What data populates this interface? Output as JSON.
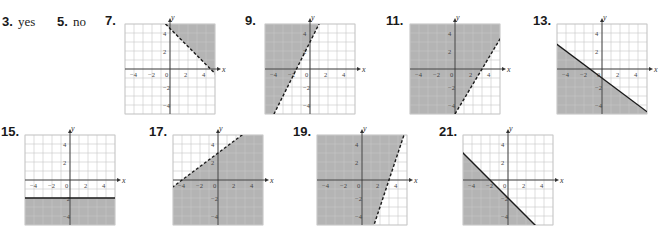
{
  "answers": [
    {
      "number": "3.",
      "text": "yes"
    },
    {
      "number": "5.",
      "text": "no"
    }
  ],
  "graphs": [
    {
      "number": "7.",
      "x": 125,
      "y": 24,
      "slope": -1,
      "intercept": 4.5,
      "vertical": null,
      "dashed": true,
      "shade": "above"
    },
    {
      "number": "9.",
      "x": 265,
      "y": 24,
      "slope": 2,
      "intercept": 3,
      "vertical": null,
      "dashed": true,
      "shade": "above"
    },
    {
      "number": "11.",
      "x": 410,
      "y": 24,
      "slope": 1.667,
      "intercept": -5,
      "vertical": null,
      "dashed": true,
      "shade": "above"
    },
    {
      "number": "13.",
      "x": 557,
      "y": 24,
      "slope": -0.75,
      "intercept": -1,
      "vertical": null,
      "dashed": false,
      "shade": "below"
    },
    {
      "number": "15.",
      "x": 25,
      "y": 135,
      "slope": 0,
      "intercept": -2,
      "vertical": null,
      "dashed": false,
      "shade": "below"
    },
    {
      "number": "17.",
      "x": 173,
      "y": 135,
      "slope": 0.75,
      "intercept": 3,
      "vertical": null,
      "dashed": true,
      "shade": "below"
    },
    {
      "number": "19.",
      "x": 317,
      "y": 135,
      "slope": 3,
      "intercept": -9,
      "vertical": null,
      "dashed": true,
      "shade": "above"
    },
    {
      "number": "21.",
      "x": 463,
      "y": 135,
      "slope": -1,
      "intercept": -2,
      "vertical": null,
      "dashed": false,
      "shade": "below"
    }
  ],
  "axis": {
    "x_label": "x",
    "y_label": "y",
    "x_ticks": [
      "−4",
      "−2",
      "0",
      "2",
      "4"
    ],
    "y_ticks": [
      "4",
      "2",
      "−2",
      "−4"
    ],
    "range": [
      -5,
      5
    ]
  },
  "colors": {
    "shade": "#b4b4b4",
    "grid": "#c8c8c8",
    "line": "#1a1a1a"
  }
}
